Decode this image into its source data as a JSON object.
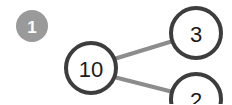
{
  "canvas": {
    "width": 232,
    "height": 104,
    "background": "#ffffff"
  },
  "colors": {
    "node_stroke": "#3d3d3d",
    "node_fill": "#ffffff",
    "connector": "#8c8c8c",
    "badge_fill": "#9a9a9a",
    "badge_text": "#ffffff",
    "digit": "#1a1a1a"
  },
  "badge": {
    "label": "1",
    "cx": 32,
    "cy": 26,
    "r": 16
  },
  "diagram": {
    "type": "number-bond",
    "whole": "10",
    "parts": [
      "3",
      "2"
    ],
    "nodes": [
      {
        "id": "whole",
        "label": "10",
        "cx": 91,
        "cy": 68,
        "r": 25,
        "clipped": false
      },
      {
        "id": "part-top",
        "label": "3",
        "cx": 196,
        "cy": 33,
        "r": 25,
        "clipped": false
      },
      {
        "id": "part-bottom",
        "label": "2",
        "cx": 196,
        "cy": 99,
        "r": 25,
        "clipped": true
      }
    ],
    "connectors": [
      {
        "from": "whole",
        "to": "part-top",
        "x1": 114,
        "y1": 59,
        "x2": 173,
        "y2": 41
      },
      {
        "from": "whole",
        "to": "part-bottom",
        "x1": 114,
        "y1": 77,
        "x2": 173,
        "y2": 92
      }
    ]
  }
}
